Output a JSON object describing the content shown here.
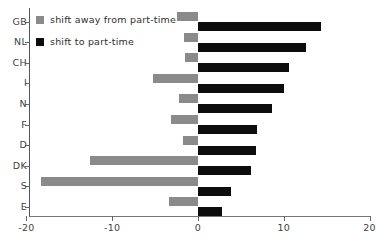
{
  "chart_data": {
    "type": "bar",
    "orientation": "horizontal",
    "title": "",
    "subtitle": "",
    "xlabel": "",
    "ylabel": "",
    "categories": [
      "GB",
      "NL",
      "CH",
      "I",
      "N",
      "F",
      "D",
      "DK",
      "S",
      "E"
    ],
    "series": [
      {
        "name": "shift away from part-time",
        "color": "#8a8a8a",
        "values": [
          -2.5,
          -1.6,
          -1.5,
          -5.2,
          -2.2,
          -3.1,
          -1.7,
          -12.6,
          -18.3,
          -3.4
        ]
      },
      {
        "name": "shift to part-time",
        "color": "#0d0d0d",
        "values": [
          14.3,
          12.6,
          10.6,
          10.0,
          8.6,
          6.9,
          6.8,
          6.2,
          3.9,
          2.8
        ]
      }
    ],
    "xlim": [
      -20,
      20
    ],
    "xticks": [
      -20,
      -10,
      0,
      10,
      20
    ],
    "xtick_labels": [
      "-20",
      "-10",
      "0",
      "10",
      "20"
    ],
    "grid": false,
    "legend_position": "top-left",
    "legend": [
      "shift away from part-time",
      "shift to part-time"
    ]
  },
  "legend": {
    "away_label": "shift away from part-time",
    "to_label": "shift to part-time"
  },
  "colors": {
    "away": "#8a8a8a",
    "to": "#0d0d0d",
    "axis": "#666666",
    "background": "#ffffff"
  }
}
